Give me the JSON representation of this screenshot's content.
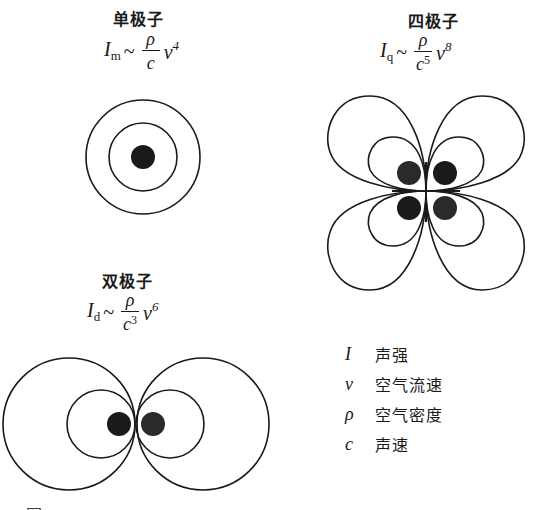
{
  "monopole": {
    "title": "单极子",
    "formula": {
      "I": "I",
      "sub": "m",
      "sim": "~",
      "num": "ρ",
      "den": "c",
      "den_exp": "",
      "v": "v",
      "v_exp": "4"
    }
  },
  "quadrupole": {
    "title": "四极子",
    "formula": {
      "I": "I",
      "sub": "q",
      "sim": "~",
      "num": "ρ",
      "den": "c",
      "den_exp": "5",
      "v": "v",
      "v_exp": "8"
    }
  },
  "dipole": {
    "title": "双极子",
    "formula": {
      "I": "I",
      "sub": "d",
      "sim": "~",
      "num": "ρ",
      "den": "c",
      "den_exp": "3",
      "v": "v",
      "v_exp": "6"
    }
  },
  "legend": [
    {
      "symbol": "I",
      "label": "声强"
    },
    {
      "symbol": "v",
      "label": "空气流速"
    },
    {
      "symbol": "ρ",
      "label": "空气密度"
    },
    {
      "symbol": "c",
      "label": "声速"
    }
  ],
  "caption": "图",
  "colors": {
    "line": "#1a1a1a",
    "source_dot": "#1a1a1a",
    "background": "#ffffff"
  }
}
